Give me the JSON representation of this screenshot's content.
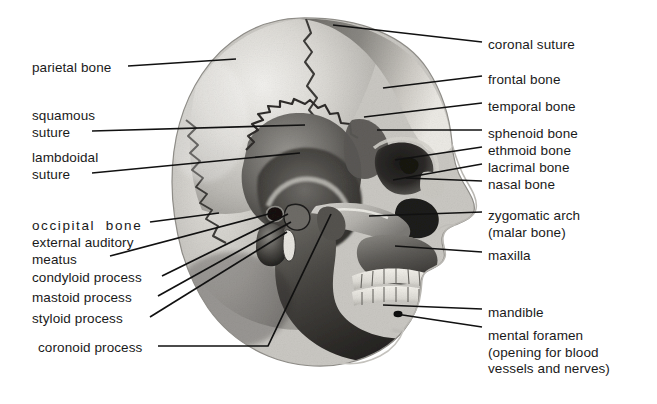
{
  "figure": {
    "background_color": "#ffffff",
    "text_color": "#1a1a1a",
    "leader_line_color": "#111111"
  },
  "labels_left": [
    {
      "id": "parietal-bone",
      "text": "parietal bone",
      "x": 32,
      "y": 60,
      "lines": 1
    },
    {
      "id": "squamous-suture",
      "text": "squamous\nsuture",
      "x": 32,
      "y": 108,
      "lines": 2
    },
    {
      "id": "lambdoidal-suture",
      "text": "lambdoidal\nsuture",
      "x": 32,
      "y": 150,
      "lines": 2
    },
    {
      "id": "occipital-bone",
      "text": "occipital  bone",
      "x": 32,
      "y": 218,
      "lines": 1
    },
    {
      "id": "external-auditory-meatus",
      "text": "external auditory\nmeatus",
      "x": 32,
      "y": 235,
      "lines": 2
    },
    {
      "id": "condyloid-process",
      "text": "condyloid process",
      "x": 32,
      "y": 270,
      "lines": 1
    },
    {
      "id": "mastoid-process",
      "text": "mastoid process",
      "x": 32,
      "y": 290,
      "lines": 1
    },
    {
      "id": "styloid-process",
      "text": "styloid process",
      "x": 32,
      "y": 311,
      "lines": 1
    },
    {
      "id": "coronoid-process",
      "text": "coronoid process",
      "x": 38,
      "y": 340,
      "lines": 1
    }
  ],
  "labels_right": [
    {
      "id": "coronal-suture",
      "text": "coronal suture",
      "x": 488,
      "y": 37,
      "lines": 1
    },
    {
      "id": "frontal-bone",
      "text": "frontal bone",
      "x": 488,
      "y": 72,
      "lines": 1
    },
    {
      "id": "temporal-bone",
      "text": "temporal bone",
      "x": 488,
      "y": 99,
      "lines": 1
    },
    {
      "id": "sphenoid-bone",
      "text": "sphenoid bone",
      "x": 488,
      "y": 126,
      "lines": 1
    },
    {
      "id": "ethmoid-bone",
      "text": "ethmoid bone",
      "x": 488,
      "y": 143,
      "lines": 1
    },
    {
      "id": "lacrimal-bone",
      "text": "lacrimal bone",
      "x": 488,
      "y": 160,
      "lines": 1
    },
    {
      "id": "nasal-bone",
      "text": "nasal bone",
      "x": 488,
      "y": 177,
      "lines": 1
    },
    {
      "id": "zygomatic-arch",
      "text": "zygomatic arch\n(malar bone)",
      "x": 488,
      "y": 208,
      "lines": 2
    },
    {
      "id": "maxilla",
      "text": "maxilla",
      "x": 488,
      "y": 248,
      "lines": 1
    },
    {
      "id": "mandible",
      "text": "mandible",
      "x": 488,
      "y": 305,
      "lines": 1
    },
    {
      "id": "mental-foramen",
      "text": "mental foramen\n(opening for blood\nvessels and nerves)",
      "x": 488,
      "y": 328,
      "lines": 3
    }
  ],
  "leaders": [
    {
      "id": "leader-parietal-bone",
      "points": "128,66 236,59"
    },
    {
      "id": "leader-squamous-suture",
      "points": "92,131 305,125"
    },
    {
      "id": "leader-lambdoidal-suture",
      "points": "92,173 300,153"
    },
    {
      "id": "leader-occipital-bone",
      "points": "150,222 219,213"
    },
    {
      "id": "leader-external-auditory-meatus",
      "points": "110,256 276,212"
    },
    {
      "id": "leader-condyloid-process",
      "points": "162,276 288,214"
    },
    {
      "id": "leader-mastoid-process",
      "points": "158,296 291,222"
    },
    {
      "id": "leader-styloid-process",
      "points": "150,317 287,232"
    },
    {
      "id": "leader-coronoid-process",
      "points": "158,346 268,346 331,214"
    },
    {
      "id": "leader-coronal-suture",
      "points": "482,42 333,25"
    },
    {
      "id": "leader-frontal-bone",
      "points": "482,76 383,88"
    },
    {
      "id": "leader-temporal-bone",
      "points": "482,103 364,117"
    },
    {
      "id": "leader-sphenoid-bone",
      "points": "482,130 377,130"
    },
    {
      "id": "leader-ethmoid-bone",
      "points": "482,147 395,160"
    },
    {
      "id": "leader-lacrimal-bone",
      "points": "482,164 393,180"
    },
    {
      "id": "leader-nasal-bone",
      "points": "482,181 406,178"
    },
    {
      "id": "leader-zygomatic-arch",
      "points": "482,212 369,216"
    },
    {
      "id": "leader-maxilla",
      "points": "482,252 395,246"
    },
    {
      "id": "leader-mandible",
      "points": "482,309 383,305"
    },
    {
      "id": "leader-mental-foramen",
      "points": "482,327 396,314"
    }
  ],
  "illustration": {
    "type": "grayscale-halftone-drawing",
    "subject": "human skull, lateral (side) view facing right",
    "regions": [
      {
        "id": "cranium-parietal",
        "tone": "#cfcdc8"
      },
      {
        "id": "frontal-bone-area",
        "tone": "#9e9c98"
      },
      {
        "id": "temporal-fossa",
        "tone": "#4a4845"
      },
      {
        "id": "occipital-area",
        "tone": "#b6b4af"
      },
      {
        "id": "orbit",
        "tone": "#2a2826"
      },
      {
        "id": "nasal-cavity",
        "tone": "#262422"
      },
      {
        "id": "mandible",
        "tone": "#46443f"
      },
      {
        "id": "teeth",
        "tone": "#e8e6e0"
      },
      {
        "id": "soft-tissue-profile",
        "tone": "#ffffff"
      }
    ]
  }
}
